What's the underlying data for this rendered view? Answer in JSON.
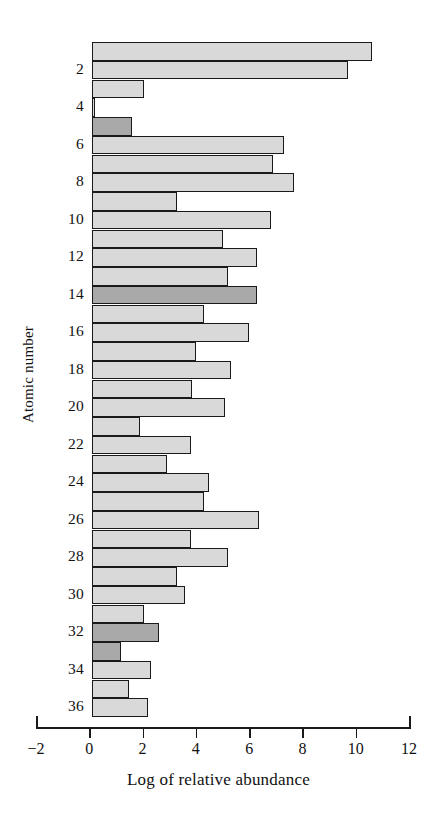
{
  "chart_data": {
    "type": "bar",
    "orientation": "horizontal",
    "title": "",
    "xlabel": "Log of relative abundance",
    "ylabel": "Atomic number",
    "xlim": [
      -2,
      12
    ],
    "ylim": [
      0.5,
      36.5
    ],
    "grid": false,
    "legend": null,
    "xticks": [
      -2,
      0,
      2,
      4,
      6,
      8,
      10,
      12
    ],
    "xtick_labels": [
      "−2",
      "0",
      "2",
      "4",
      "6",
      "8",
      "10",
      "12"
    ],
    "yticks": [
      2,
      4,
      6,
      8,
      10,
      12,
      14,
      16,
      18,
      20,
      22,
      24,
      26,
      28,
      30,
      32,
      34,
      36
    ],
    "ytick_labels": [
      "2",
      "4",
      "6",
      "8",
      "10",
      "12",
      "14",
      "16",
      "18",
      "20",
      "22",
      "24",
      "26",
      "28",
      "30",
      "32",
      "34",
      "36"
    ],
    "series": [
      {
        "name": "Log of relative abundance",
        "categories": [
          1,
          2,
          3,
          4,
          5,
          6,
          7,
          8,
          9,
          10,
          11,
          12,
          13,
          14,
          15,
          16,
          17,
          18,
          19,
          20,
          21,
          22,
          23,
          24,
          25,
          26,
          27,
          28,
          29,
          30,
          31,
          32,
          33,
          34,
          35,
          36
        ],
        "values": [
          10.5,
          9.6,
          1.95,
          0.12,
          1.5,
          7.2,
          6.8,
          7.6,
          3.2,
          6.7,
          4.9,
          6.2,
          5.1,
          6.2,
          4.2,
          5.9,
          3.9,
          5.2,
          3.75,
          5.0,
          1.8,
          3.7,
          2.8,
          4.4,
          4.2,
          6.25,
          3.7,
          5.1,
          3.2,
          3.5,
          1.95,
          2.5,
          1.1,
          2.2,
          1.4,
          2.1
        ],
        "highlighted": [
          5,
          14,
          32,
          33
        ]
      }
    ],
    "colors": {
      "bar_light": "#d9d9d9",
      "bar_dark": "#a9a9a9",
      "bar_outline": "#1a1a1a",
      "axis": "#1a1a1a",
      "background": "#ffffff",
      "text": "#111111"
    }
  }
}
